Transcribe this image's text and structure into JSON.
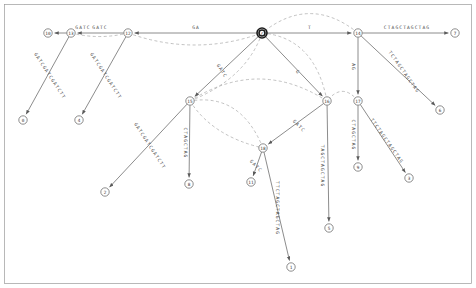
{
  "diagram": {
    "colors": {
      "edge": "#6e6e6e",
      "suffix_link": "#a8a8a8",
      "node_stroke": "#6e6e6e",
      "root_stroke": "#1a1a1a",
      "text": "#4a4a4a",
      "frame": "#9a9a9a",
      "background": "#ffffff"
    },
    "nodes": [
      {
        "id": "root",
        "label": "r",
        "x": 262,
        "y": 33,
        "kind": "root",
        "r": 5.0
      },
      {
        "id": "n12",
        "label": "12",
        "x": 128,
        "y": 33,
        "kind": "internal",
        "r": 4.2
      },
      {
        "id": "n13",
        "label": "13",
        "x": 71,
        "y": 33,
        "kind": "internal",
        "r": 4.2
      },
      {
        "id": "n14",
        "label": "14",
        "x": 358,
        "y": 33,
        "kind": "internal",
        "r": 4.2
      },
      {
        "id": "n15",
        "label": "15",
        "x": 190,
        "y": 101,
        "kind": "internal",
        "r": 4.2
      },
      {
        "id": "n16",
        "label": "16",
        "x": 327,
        "y": 101,
        "kind": "internal",
        "r": 4.2
      },
      {
        "id": "n17",
        "label": "17",
        "x": 358,
        "y": 101,
        "kind": "internal",
        "r": 4.2
      },
      {
        "id": "n18",
        "label": "18",
        "x": 263,
        "y": 148,
        "kind": "internal",
        "r": 4.2
      },
      {
        "id": "n10",
        "label": "10",
        "x": 48,
        "y": 33,
        "kind": "leaf",
        "r": 4.2
      },
      {
        "id": "n0",
        "label": "0",
        "x": 23,
        "y": 120,
        "kind": "leaf",
        "r": 4.2
      },
      {
        "id": "n4",
        "label": "4",
        "x": 79,
        "y": 120,
        "kind": "leaf",
        "r": 4.2
      },
      {
        "id": "n2",
        "label": "2",
        "x": 105,
        "y": 192,
        "kind": "leaf",
        "r": 4.2
      },
      {
        "id": "n8",
        "label": "8",
        "x": 189,
        "y": 184,
        "kind": "leaf",
        "r": 4.2
      },
      {
        "id": "n11",
        "label": "11",
        "x": 251,
        "y": 182,
        "kind": "leaf",
        "r": 4.2
      },
      {
        "id": "n1",
        "label": "1",
        "x": 291,
        "y": 267,
        "kind": "leaf",
        "r": 4.2
      },
      {
        "id": "n5",
        "label": "5",
        "x": 329,
        "y": 228,
        "kind": "leaf",
        "r": 4.2
      },
      {
        "id": "n9",
        "label": "9",
        "x": 358,
        "y": 167,
        "kind": "leaf",
        "r": 4.2
      },
      {
        "id": "n3",
        "label": "3",
        "x": 409,
        "y": 178,
        "kind": "leaf",
        "r": 4.2
      },
      {
        "id": "n6",
        "label": "6",
        "x": 440,
        "y": 110,
        "kind": "leaf",
        "r": 4.2
      },
      {
        "id": "n7",
        "label": "7",
        "x": 455,
        "y": 33,
        "kind": "leaf",
        "r": 4.2
      }
    ],
    "edges": [
      {
        "from": "root",
        "to": "n12",
        "label": "GA",
        "lx": 196,
        "ly": 27,
        "rot": 0
      },
      {
        "from": "n12",
        "to": "n13",
        "label": "GATC",
        "lx": 100,
        "ly": 27,
        "rot": 0
      },
      {
        "from": "n13",
        "to": "n10",
        "label": "GATC",
        "lx": 83,
        "ly": 27,
        "rot": 0
      },
      {
        "from": "root",
        "to": "n14",
        "label": "T",
        "lx": 310,
        "ly": 27,
        "rot": 0
      },
      {
        "from": "n14",
        "to": "n7",
        "label": "CTAGCTAGCTAG",
        "lx": 407,
        "ly": 27,
        "rot": 0
      },
      {
        "from": "n13",
        "to": "n0",
        "label": "GATCGATCGATCTT",
        "lx": 50,
        "ly": 76,
        "rot": 57
      },
      {
        "from": "n12",
        "to": "n4",
        "label": "GATCGATCGATCTT",
        "lx": 106,
        "ly": 76,
        "rot": 57
      },
      {
        "from": "n15",
        "to": "n2",
        "label": "GATCGATCGATCTT",
        "lx": 150,
        "ly": 146,
        "rot": 57
      },
      {
        "from": "root",
        "to": "n15",
        "label": "GATC",
        "lx": 222,
        "ly": 71,
        "rot": 57
      },
      {
        "from": "n15",
        "to": "n8",
        "label": "CTAGCTAG",
        "lx": 185,
        "ly": 143,
        "rot": 90
      },
      {
        "from": "root",
        "to": "n16",
        "label": "G",
        "lx": 298,
        "ly": 72,
        "rot": 40
      },
      {
        "from": "n18",
        "to": "n11",
        "label": "GATC",
        "lx": 256,
        "ly": 166,
        "rot": 45
      },
      {
        "from": "n18",
        "to": "n1",
        "label": "TTCTAGCTAGCTAG",
        "lx": 277,
        "ly": 208,
        "rot": 90
      },
      {
        "from": "n16",
        "to": "n18",
        "label": "GATC",
        "lx": 299,
        "ly": 126,
        "rot": 45
      },
      {
        "from": "n16",
        "to": "n5",
        "label": "TAGCTAGCTAG",
        "lx": 322,
        "ly": 166,
        "rot": 90
      },
      {
        "from": "n14",
        "to": "n17",
        "label": "AG",
        "lx": 353,
        "ly": 67,
        "rot": 90
      },
      {
        "from": "n17",
        "to": "n9",
        "label": "CTAGCTAG",
        "lx": 353,
        "ly": 135,
        "rot": 90
      },
      {
        "from": "n17",
        "to": "n3",
        "label": "TTCTAGCTAGCTAG",
        "lx": 387,
        "ly": 141,
        "rot": 55
      },
      {
        "from": "n14",
        "to": "n6",
        "label": "TCTAGCTAGCTAG",
        "lx": 404,
        "ly": 72,
        "rot": 55
      }
    ],
    "suffix_links": [
      {
        "from": "n12",
        "to": "root"
      },
      {
        "from": "n13",
        "to": "n12"
      },
      {
        "from": "n14",
        "to": "root"
      },
      {
        "from": "n15",
        "to": "root"
      },
      {
        "from": "n16",
        "to": "root"
      },
      {
        "from": "n17",
        "to": "n16"
      },
      {
        "from": "n18",
        "to": "n15"
      },
      {
        "from": "n16",
        "to": "n15"
      },
      {
        "from": "n15",
        "to": "n18"
      }
    ]
  }
}
